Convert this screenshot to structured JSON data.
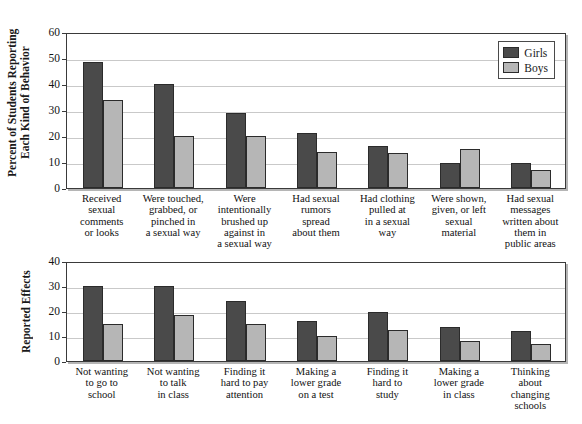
{
  "chart_data": [
    {
      "type": "bar",
      "id": "behaviors",
      "title": "",
      "xlabel": "",
      "ylabel": "Percent of Students Reporting\nEach Kind of Behavior",
      "ylim": [
        0,
        60
      ],
      "ytick_labels": [
        "60",
        "50",
        "40",
        "30",
        "20",
        "10",
        "0"
      ],
      "ytick_values": [
        60,
        50,
        40,
        30,
        20,
        10,
        0
      ],
      "grid": true,
      "legend_position": "top-right",
      "legend": [
        "Girls",
        "Boys"
      ],
      "categories": [
        "Received\nsexual\ncomments\nor looks",
        "Were touched,\ngrabbed, or\npinched in\na sexual way",
        "Were\nintentionally\nbrushed up\nagainst in\na sexual way",
        "Had sexual\nrumors\nspread\nabout them",
        "Had clothing\npulled at\nin a sexual\nway",
        "Were shown,\ngiven, or left\nsexual\nmaterial",
        "Had sexual\nmessages\nwritten about\nthem in\npublic areas"
      ],
      "series": [
        {
          "name": "Girls",
          "color": "#4a4a4a",
          "values": [
            48.5,
            40,
            29,
            21,
            16,
            9.5,
            9.5
          ]
        },
        {
          "name": "Boys",
          "color": "#b6b6b6",
          "values": [
            34,
            20,
            20,
            14,
            13.5,
            15,
            7
          ]
        }
      ]
    },
    {
      "type": "bar",
      "id": "effects",
      "title": "",
      "xlabel": "",
      "ylabel": "Reported Effects",
      "ylim": [
        0,
        40
      ],
      "ytick_labels": [
        "40",
        "30",
        "20",
        "10",
        "0"
      ],
      "ytick_values": [
        40,
        30,
        20,
        10,
        0
      ],
      "grid": true,
      "legend_position": "none",
      "legend": [
        "Girls",
        "Boys"
      ],
      "categories": [
        "Not wanting\nto go to\nschool",
        "Not wanting\nto talk\nin class",
        "Finding it\nhard to pay\nattention",
        "Making a\nlower grade\non a test",
        "Finding it\nhard to\nstudy",
        "Making a\nlower grade\nin class",
        "Thinking\nabout\nchanging\nschools"
      ],
      "series": [
        {
          "name": "Girls",
          "color": "#4a4a4a",
          "values": [
            30,
            30,
            24,
            16,
            19.5,
            13.5,
            12
          ]
        },
        {
          "name": "Boys",
          "color": "#b6b6b6",
          "values": [
            15,
            18.5,
            15,
            10,
            12.5,
            8,
            7
          ]
        }
      ]
    }
  ],
  "colors": {
    "girls": "#4a4a4a",
    "boys": "#b6b6b6",
    "grid": "#c9c9c9",
    "axis": "#3a3a3a",
    "background": "#ffffff"
  }
}
